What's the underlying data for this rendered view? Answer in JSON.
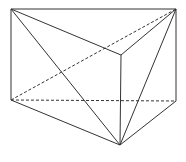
{
  "diagram": {
    "type": "triangular-prism",
    "vertices": {
      "A": [
        11,
        9
      ],
      "B": [
        176,
        9
      ],
      "C": [
        121,
        55
      ],
      "A1": [
        11,
        100
      ],
      "B1": [
        176,
        101
      ],
      "C1": [
        120,
        145
      ]
    },
    "solid_edges": [
      [
        "A",
        "B"
      ],
      [
        "A",
        "C"
      ],
      [
        "B",
        "C"
      ],
      [
        "A",
        "A1"
      ],
      [
        "B",
        "B1"
      ],
      [
        "C",
        "C1"
      ],
      [
        "A1",
        "C1"
      ],
      [
        "B1",
        "C1"
      ],
      [
        "A",
        "C1"
      ],
      [
        "B",
        "C1"
      ]
    ],
    "dashed_edges": [
      [
        "A1",
        "B1"
      ],
      [
        "A1",
        "B"
      ]
    ],
    "stroke_color": "#333333"
  }
}
